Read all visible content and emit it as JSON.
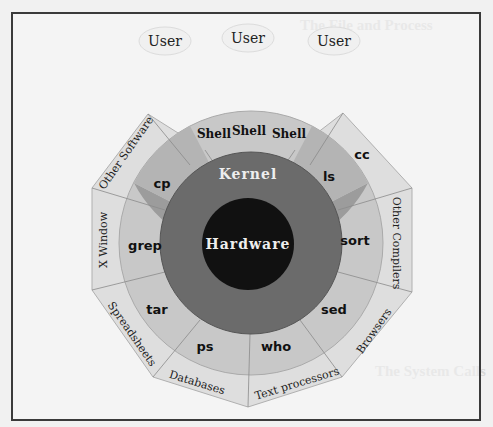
{
  "background_text": {
    "heading_top": "The File and Process",
    "heading_bottom": "The System Calls"
  },
  "users": [
    {
      "label": "User"
    },
    {
      "label": "User"
    },
    {
      "label": "User"
    }
  ],
  "hardware": {
    "label": "Hardware"
  },
  "kernel": {
    "label": "Kernel"
  },
  "shells": [
    {
      "label": "Shell"
    },
    {
      "label": "Shell"
    },
    {
      "label": "Shell"
    }
  ],
  "commands": [
    {
      "label": "cp"
    },
    {
      "label": "ls"
    },
    {
      "label": "grep"
    },
    {
      "label": "sort"
    },
    {
      "label": "tar"
    },
    {
      "label": "sed"
    },
    {
      "label": "ps"
    },
    {
      "label": "who"
    }
  ],
  "applications": [
    {
      "label": "cc"
    },
    {
      "label": "Other Compilers"
    },
    {
      "label": "Browsers"
    },
    {
      "label": "Text processors"
    },
    {
      "label": "Databases"
    },
    {
      "label": "Spreadsheets"
    },
    {
      "label": "X Window"
    },
    {
      "label": "Other Software"
    }
  ],
  "colors": {
    "hardware": "#101010",
    "kernel": "#6a6a6a",
    "commands": "#9a9a9a",
    "shell": "#c9c9c9",
    "applications": "#dcdcdc",
    "frame": "#3a3a3a"
  }
}
